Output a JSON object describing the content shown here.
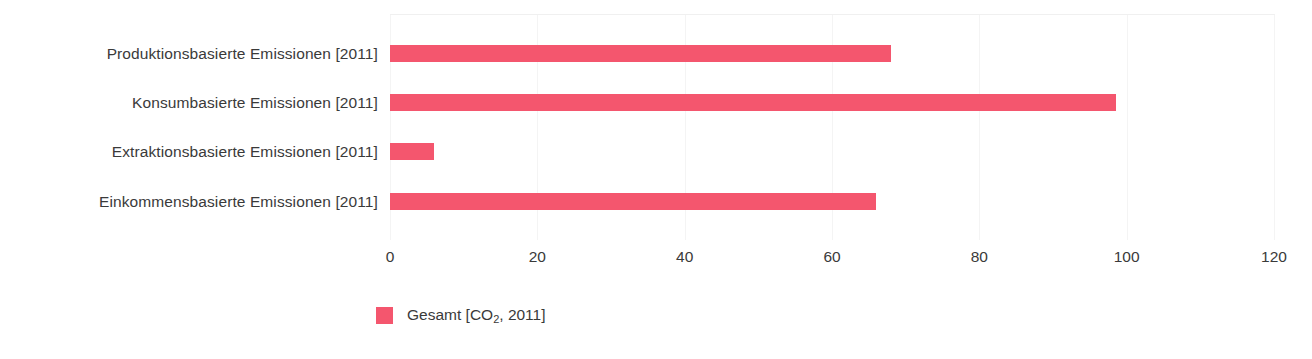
{
  "chart_data": {
    "type": "bar",
    "orientation": "horizontal",
    "title": "",
    "xlabel": "",
    "ylabel": "",
    "categories": [
      "Produktionsbasierte Emissionen [2011]",
      "Konsumbasierte Emissionen [2011]",
      "Extraktionsbasierte Emissionen [2011]",
      "Einkommensbasierte Emissionen [2011]"
    ],
    "series": [
      {
        "name": "Gesamt [CO2, 2011]",
        "color": "#f4566e",
        "values": [
          68,
          98.6,
          6,
          66
        ]
      }
    ],
    "values": [
      68,
      98.6,
      6,
      66
    ],
    "xlim": [
      0,
      120
    ],
    "xticks": [
      0,
      20,
      40,
      60,
      80,
      100,
      120
    ],
    "xtick_labels": [
      "0",
      "20",
      "40",
      "60",
      "80",
      "100",
      "120"
    ],
    "grid": true,
    "grid_axis": "x",
    "legend": {
      "position": "bottom-left",
      "entries": [
        {
          "label_prefix": "Gesamt [CO",
          "label_sub": "2",
          "label_suffix": ", 2011]",
          "color": "#f4566e"
        }
      ]
    }
  },
  "colors": {
    "bar": "#f4566e",
    "text": "#3a3a3a",
    "grid": "#f4f4f4",
    "background": "#ffffff"
  }
}
